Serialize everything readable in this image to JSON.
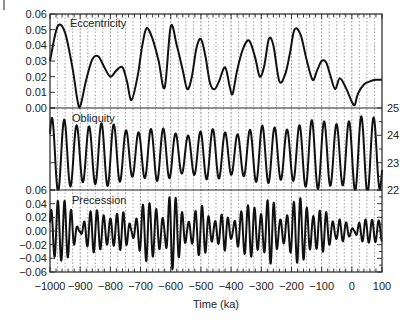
{
  "chart_data": [
    {
      "type": "line",
      "panel": "top",
      "title": "Eccentricity",
      "ylabel": "",
      "ylim": [
        0.0,
        0.06
      ],
      "yticks": [
        "0.06",
        "0.05",
        "0.04",
        "0.03",
        "0.02",
        "0.01",
        "0.00"
      ],
      "ytick_values": [
        0.06,
        0.05,
        0.04,
        0.03,
        0.02,
        0.01,
        0.0
      ],
      "yaxis_side": "left",
      "x": [
        -1000,
        -975,
        -950,
        -925,
        -910,
        -900,
        -880,
        -860,
        -840,
        -820,
        -800,
        -780,
        -760,
        -745,
        -730,
        -710,
        -695,
        -680,
        -660,
        -640,
        -620,
        -600,
        -580,
        -560,
        -545,
        -530,
        -515,
        -500,
        -485,
        -470,
        -455,
        -440,
        -420,
        -405,
        -395,
        -380,
        -360,
        -340,
        -320,
        -305,
        -290,
        -275,
        -260,
        -240,
        -220,
        -205,
        -190,
        -170,
        -150,
        -130,
        -115,
        -100,
        -85,
        -70,
        -55,
        -40,
        -20,
        0,
        10,
        20,
        40,
        60,
        80,
        100
      ],
      "series": [
        {
          "name": "Eccentricity",
          "values": [
            0.03,
            0.052,
            0.048,
            0.025,
            0.006,
            0.001,
            0.018,
            0.031,
            0.033,
            0.026,
            0.02,
            0.024,
            0.026,
            0.017,
            0.005,
            0.02,
            0.039,
            0.051,
            0.044,
            0.03,
            0.013,
            0.052,
            0.04,
            0.024,
            0.012,
            0.02,
            0.038,
            0.044,
            0.033,
            0.016,
            0.012,
            0.017,
            0.026,
            0.014,
            0.009,
            0.024,
            0.038,
            0.043,
            0.032,
            0.02,
            0.027,
            0.044,
            0.04,
            0.017,
            0.022,
            0.035,
            0.05,
            0.047,
            0.031,
            0.018,
            0.024,
            0.03,
            0.029,
            0.02,
            0.012,
            0.019,
            0.013,
            0.004,
            0.002,
            0.009,
            0.015,
            0.017,
            0.018,
            0.018
          ]
        }
      ]
    },
    {
      "type": "line",
      "panel": "middle",
      "title": "Obliquity",
      "ylim": [
        22,
        25
      ],
      "yticks": [
        "25",
        "24",
        "23",
        "22"
      ],
      "ytick_values": [
        25,
        24,
        23,
        22
      ],
      "yaxis_side": "right",
      "period_ka": 41,
      "mean_deg": 23.3,
      "series": [
        {
          "name": "Obliquity",
          "note": "~41 ka oscillation between ~22.1 and ~24.5 degrees"
        }
      ]
    },
    {
      "type": "line",
      "panel": "bottom",
      "title": "Precession",
      "ylim": [
        -0.06,
        0.06
      ],
      "yticks": [
        "0.06",
        "0.04",
        "0.02",
        "0.00",
        "-0.02",
        "-0.04",
        "-0.06"
      ],
      "ytick_values": [
        0.06,
        0.04,
        0.02,
        0.0,
        -0.02,
        -0.04,
        -0.06
      ],
      "yaxis_side": "left",
      "period_ka": 21,
      "series": [
        {
          "name": "Precession",
          "note": "~21 ka oscillation modulated in amplitude by eccentricity"
        }
      ]
    }
  ],
  "xaxis": {
    "label": "Time (ka)",
    "xlim": [
      -1000,
      100
    ],
    "ticks": [
      "-1000",
      "-900",
      "-800",
      "-700",
      "-600",
      "-500",
      "-400",
      "-300",
      "-200",
      "-100",
      "0",
      "100"
    ],
    "tick_values": [
      -1000,
      -900,
      -800,
      -700,
      -600,
      -500,
      -400,
      -300,
      -200,
      -100,
      0,
      100
    ]
  },
  "grid": {
    "vertical_dotted_ka": [
      -975,
      -950,
      -925,
      -875,
      -850,
      -825,
      -775,
      -750,
      -725,
      -675,
      -650,
      -625,
      -575,
      -550,
      -525,
      -475,
      -450,
      -425,
      -375,
      -350,
      -325,
      -275,
      -250,
      -225,
      -175,
      -150,
      -125,
      -75,
      -50,
      -25,
      25,
      50,
      75
    ],
    "vertical_solid_ka": [
      -900,
      -800,
      -700,
      -600,
      -500,
      -400,
      -300,
      -200,
      -100,
      0
    ]
  },
  "colors": {
    "line": "#111111",
    "frame": "#222222",
    "grid": "#888888",
    "text": "#222222"
  }
}
